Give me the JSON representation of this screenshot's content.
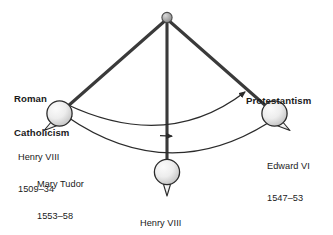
{
  "diagram": {
    "type": "pendulum-diagram",
    "background_color": "#ffffff",
    "rod_color": "#3a3a3a",
    "bob_fill_light": "#f4f4f4",
    "bob_fill_dark": "#c9c9c9",
    "bob_stroke": "#2b2b2b",
    "arc_color": "#2b2b2b",
    "pivot_color": "#8f8f8f",
    "poles": [
      {
        "id": "roman-catholicism",
        "label_line1": "Roman",
        "label_line2": "Catholicism",
        "side": "left"
      },
      {
        "id": "protestantism",
        "label_line1": "Protestantism",
        "label_line2": "",
        "side": "right"
      }
    ],
    "bobs": [
      {
        "id": "left-bob",
        "position": "left",
        "ruler": "Henry VIII",
        "years": "1509–34",
        "secondary_ruler": "Mary Tudor",
        "secondary_years": "1553–58"
      },
      {
        "id": "center-bob",
        "position": "center",
        "ruler": "Henry VIII",
        "years": "1534–47"
      },
      {
        "id": "right-bob",
        "position": "right",
        "ruler": "Edward VI",
        "years": "1547–53"
      }
    ],
    "arcs": [
      {
        "id": "arc-upper",
        "description": "swing from Roman Catholicism toward Protestantism",
        "arrow_at_center": "right",
        "arrow_at_end": "up-right"
      },
      {
        "id": "arc-lower",
        "description": "swing back from Protestantism toward Roman Catholicism",
        "arrow_at_end": "up-left"
      }
    ]
  }
}
